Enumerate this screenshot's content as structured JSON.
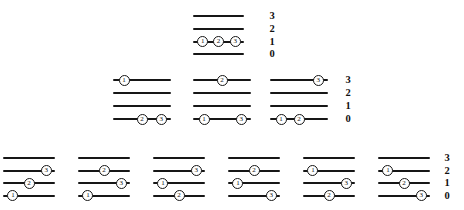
{
  "figure": {
    "colors": {
      "background": "#ffffff",
      "line": "#161616",
      "bead_fill": "#ffffff",
      "text": "#111111"
    },
    "level_labels": [
      "3",
      "2",
      "1",
      "0"
    ],
    "bead_fracs": {
      "1": 0.19,
      "2": 0.5,
      "3": 0.83
    },
    "rows": [
      {
        "name": "row-1",
        "y": 15,
        "gap": 12.8,
        "width": 51,
        "labels_x": 272,
        "diagrams": [
          {
            "x": 193,
            "beads": [
              {
                "level": 1,
                "n": "1"
              },
              {
                "level": 1,
                "n": "2"
              },
              {
                "level": 1,
                "n": "3"
              }
            ]
          }
        ]
      },
      {
        "name": "row-2",
        "y": 79,
        "gap": 13,
        "width": 58,
        "labels_x": 348,
        "diagrams": [
          {
            "x": 113,
            "beads": [
              {
                "level": 3,
                "n": "1"
              },
              {
                "level": 0,
                "n": "2"
              },
              {
                "level": 0,
                "n": "3"
              }
            ]
          },
          {
            "x": 193,
            "beads": [
              {
                "level": 3,
                "n": "2"
              },
              {
                "level": 0,
                "n": "1"
              },
              {
                "level": 0,
                "n": "3"
              }
            ]
          },
          {
            "x": 270,
            "beads": [
              {
                "level": 3,
                "n": "3"
              },
              {
                "level": 0,
                "n": "1"
              },
              {
                "level": 0,
                "n": "2"
              }
            ]
          }
        ]
      },
      {
        "name": "row-3",
        "y": 157,
        "gap": 12.6,
        "width": 52,
        "labels_x": 447,
        "diagrams": [
          {
            "x": 3,
            "beads": [
              {
                "level": 2,
                "n": "3"
              },
              {
                "level": 1,
                "n": "2"
              },
              {
                "level": 0,
                "n": "1"
              }
            ]
          },
          {
            "x": 78,
            "beads": [
              {
                "level": 2,
                "n": "2"
              },
              {
                "level": 1,
                "n": "3"
              },
              {
                "level": 0,
                "n": "1"
              }
            ]
          },
          {
            "x": 153,
            "beads": [
              {
                "level": 2,
                "n": "3"
              },
              {
                "level": 1,
                "n": "1"
              },
              {
                "level": 0,
                "n": "2"
              }
            ]
          },
          {
            "x": 228,
            "beads": [
              {
                "level": 2,
                "n": "2"
              },
              {
                "level": 1,
                "n": "1"
              },
              {
                "level": 0,
                "n": "3"
              }
            ]
          },
          {
            "x": 303,
            "beads": [
              {
                "level": 2,
                "n": "1"
              },
              {
                "level": 1,
                "n": "3"
              },
              {
                "level": 0,
                "n": "2"
              }
            ]
          },
          {
            "x": 378,
            "beads": [
              {
                "level": 2,
                "n": "1"
              },
              {
                "level": 1,
                "n": "2"
              },
              {
                "level": 0,
                "n": "3"
              }
            ]
          }
        ]
      }
    ]
  }
}
